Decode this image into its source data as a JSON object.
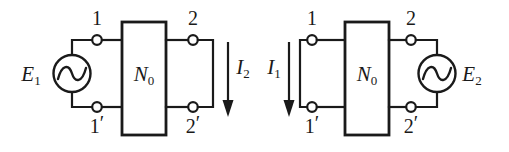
{
  "figure": {
    "background_color": "#ffffff",
    "line_color": "#1a1a1a"
  },
  "circuits": [
    {
      "id": "circuit-left",
      "network_label": "N",
      "network_subscript": "0",
      "source": {
        "symbol": "ac-source",
        "label": "E",
        "subscript": "1",
        "side": "left"
      },
      "current": {
        "label": "I",
        "subscript": "2",
        "direction": "down",
        "side": "right"
      },
      "terminals": [
        {
          "name": "terminal-1",
          "label": "1",
          "prime": "",
          "position": "top-left"
        },
        {
          "name": "terminal-1p",
          "label": "1",
          "prime": "′",
          "position": "bottom-left"
        },
        {
          "name": "terminal-2",
          "label": "2",
          "prime": "",
          "position": "top-right"
        },
        {
          "name": "terminal-2p",
          "label": "2",
          "prime": "′",
          "position": "bottom-right"
        }
      ]
    },
    {
      "id": "circuit-right",
      "network_label": "N",
      "network_subscript": "0",
      "source": {
        "symbol": "ac-source",
        "label": "E",
        "subscript": "2",
        "side": "right"
      },
      "current": {
        "label": "I",
        "subscript": "1",
        "direction": "down",
        "side": "left"
      },
      "terminals": [
        {
          "name": "terminal-1",
          "label": "1",
          "prime": "",
          "position": "top-left"
        },
        {
          "name": "terminal-1p",
          "label": "1",
          "prime": "′",
          "position": "bottom-left"
        },
        {
          "name": "terminal-2",
          "label": "2",
          "prime": "",
          "position": "top-right"
        },
        {
          "name": "terminal-2p",
          "label": "2",
          "prime": "′",
          "position": "bottom-right"
        }
      ]
    }
  ]
}
